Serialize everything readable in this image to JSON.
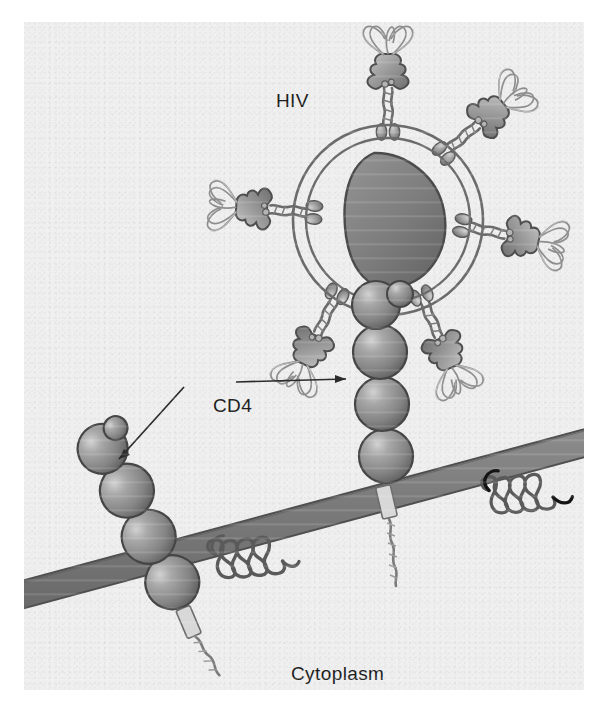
{
  "figure": {
    "background_color": "#efefef",
    "page_color": "#ffffff"
  },
  "labels": {
    "hiv": "HIV",
    "cd4": "CD4",
    "cytoplasm": "Cytoplasm"
  },
  "annotations": {
    "cd4_arrow_right": "arrow from CD4 label to membrane-bound CD4 receptor engaged by virus",
    "cd4_arrow_left": "arrow from CD4 label to free CD4 receptor on membrane"
  },
  "diagram": {
    "virus": {
      "name": "HIV virion",
      "center_x": 388,
      "center_y": 220,
      "outer_radius": 95,
      "inner_radius": 82,
      "envelope_color": "#6e6e6e",
      "capsid": {
        "name": "conical capsid core",
        "fill_color": "#7c7c7c",
        "outline_color": "#4a4a4a"
      },
      "spikes": [
        {
          "name": "envelope-glycoprotein-spike",
          "angle_deg": 270,
          "position": "top"
        },
        {
          "name": "envelope-glycoprotein-spike",
          "angle_deg": 320,
          "position": "upper-right"
        },
        {
          "name": "envelope-glycoprotein-spike",
          "angle_deg": 10,
          "position": "right"
        },
        {
          "name": "envelope-glycoprotein-spike",
          "angle_deg": 65,
          "position": "lower-right"
        },
        {
          "name": "envelope-glycoprotein-spike",
          "angle_deg": 125,
          "position": "lower-left"
        },
        {
          "name": "envelope-glycoprotein-spike",
          "angle_deg": 190,
          "position": "left"
        }
      ],
      "spike_parts": {
        "head": "gp120 knob with looped ribbon domains",
        "stem": "gp41 transmembrane stalk with two oval feet",
        "head_color": "#9a9a9a",
        "loop_color": "#bdbdbd"
      }
    },
    "membrane": {
      "name": "host cell plasma membrane",
      "fill_color": "#7a7a7a",
      "edge_color": "#4d4d4d",
      "thickness_px": 26,
      "tilt_deg": -13
    },
    "receptors": [
      {
        "name": "cd4-receptor-bound",
        "label": "CD4",
        "domain_count": 4,
        "orientation": "vertical",
        "state": "engaged by HIV spike",
        "sphere_color": "#8a8a8a"
      },
      {
        "name": "cd4-receptor-free",
        "label": "CD4",
        "domain_count": 4,
        "orientation": "tilted",
        "state": "unbound",
        "sphere_color": "#8a8a8a"
      }
    ],
    "coreceptors": [
      {
        "name": "chemokine-coreceptor-left",
        "description": "seven-transmembrane coiled coreceptor",
        "stroke_color": "#5a5a5a"
      },
      {
        "name": "chemokine-coreceptor-right",
        "description": "seven-transmembrane coiled coreceptor",
        "stroke_color": "#141414"
      }
    ]
  }
}
